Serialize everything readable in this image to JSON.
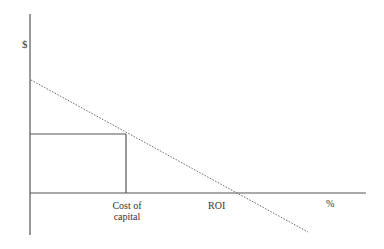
{
  "diagram": {
    "type": "roi-vs-cost-of-capital",
    "y_axis_label": "$",
    "x_axis_label": "%",
    "labels": {
      "cost_of_capital_line1": "Cost of",
      "cost_of_capital_line2": "capital",
      "roi": "ROI"
    },
    "elements": [
      {
        "kind": "axis",
        "orientation": "vertical"
      },
      {
        "kind": "axis",
        "orientation": "horizontal"
      },
      {
        "kind": "rectangle",
        "description": "area bounded by cost of capital and return curve"
      },
      {
        "kind": "dotted-line",
        "description": "declining marginal return curve crossing x-axis at ROI"
      }
    ],
    "colors": {
      "line": "#555555",
      "dotted": "#666666",
      "text": "#333333"
    }
  }
}
